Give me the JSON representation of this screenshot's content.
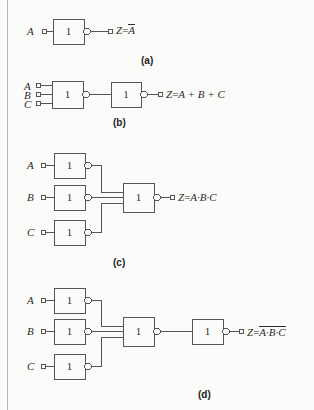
{
  "figure": {
    "background_color": "#fbfbf9",
    "line_color": "#555555",
    "text_color": "#2b2b2b",
    "gate_symbol": "1",
    "gate_style": "IEC rectangular with inversion bubble"
  },
  "panels": [
    {
      "id": "a",
      "caption": "(a)",
      "inputs": [
        "A"
      ],
      "gates": [
        {
          "label": "1",
          "inverted_output": true
        }
      ],
      "output": {
        "var": "Z",
        "eq": "=",
        "expr": "A",
        "overline": true,
        "text": "Z = A̅"
      }
    },
    {
      "id": "b",
      "caption": "(b)",
      "inputs": [
        "A",
        "B",
        "C"
      ],
      "gates": [
        {
          "label": "1",
          "inverted_output": true
        },
        {
          "label": "1",
          "inverted_output": true
        }
      ],
      "output": {
        "var": "Z",
        "eq": "=",
        "expr": "A + B + C",
        "overline": false,
        "text": "Z = A + B + C"
      }
    },
    {
      "id": "c",
      "caption": "(c)",
      "inputs": [
        "A",
        "B",
        "C"
      ],
      "gates": [
        {
          "label": "1",
          "inverted_output": true
        },
        {
          "label": "1",
          "inverted_output": true
        },
        {
          "label": "1",
          "inverted_output": true
        },
        {
          "label": "1",
          "inverted_output": true
        }
      ],
      "output": {
        "var": "Z",
        "eq": "=",
        "expr": "A·B·C",
        "overline": false,
        "text": "Z = A·B·C"
      }
    },
    {
      "id": "d",
      "caption": "(d)",
      "inputs": [
        "A",
        "B",
        "C"
      ],
      "gates": [
        {
          "label": "1",
          "inverted_output": true
        },
        {
          "label": "1",
          "inverted_output": true
        },
        {
          "label": "1",
          "inverted_output": true
        },
        {
          "label": "1",
          "inverted_output": true
        },
        {
          "label": "1",
          "inverted_output": true
        }
      ],
      "output": {
        "var": "Z",
        "eq": "=",
        "expr": "A·B·C",
        "overline": true,
        "text": "Z = A·B·C (overlined)"
      }
    }
  ],
  "labels": {
    "A": "A",
    "B": "B",
    "C": "C",
    "Z": "Z",
    "equals": "=",
    "gate_one": "1",
    "expr_b": "A + B + C",
    "expr_c": "A·B·C",
    "expr_d": "A·B·C",
    "expr_a": "A",
    "cap_a": "(a)",
    "cap_b": "(b)",
    "cap_c": "(c)",
    "cap_d": "(d)"
  }
}
